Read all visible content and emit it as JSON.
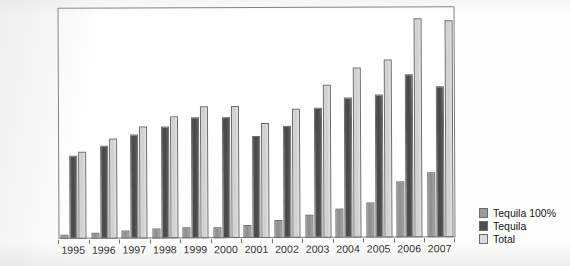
{
  "chart_data": {
    "type": "bar",
    "title": "",
    "subtitle": "",
    "xlabel": "",
    "ylabel": "",
    "grid": false,
    "legend_position": "right",
    "axis_frame": true,
    "y_tick_labels": [],
    "categories": [
      "1995",
      "1996",
      "1997",
      "1998",
      "1999",
      "2000",
      "2001",
      "2002",
      "2003",
      "2004",
      "2005",
      "2006",
      "2007"
    ],
    "series": [
      {
        "name": "Tequila 100%",
        "color": "#9b9b9b",
        "values": [
          5,
          8,
          10,
          12,
          14,
          14,
          16,
          22,
          29,
          37,
          44,
          70,
          82
        ]
      },
      {
        "name": "Tequila",
        "color": "#4d4d4d",
        "values": [
          104,
          117,
          131,
          141,
          152,
          152,
          128,
          140,
          163,
          176,
          180,
          205,
          190
        ]
      },
      {
        "name": "Total",
        "color": "#dcdcdc",
        "values": [
          109,
          125,
          141,
          153,
          166,
          166,
          144,
          162,
          192,
          213,
          224,
          275,
          272
        ]
      }
    ],
    "ylim": [
      0,
      290
    ]
  },
  "legend": {
    "items": [
      {
        "label": "Tequila 100%"
      },
      {
        "label": "Tequila"
      },
      {
        "label": "Total"
      }
    ]
  }
}
